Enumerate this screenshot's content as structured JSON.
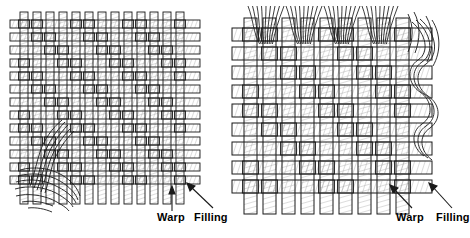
{
  "figure": {
    "background_color": "#ffffff",
    "line_color": "#1a1a1a",
    "yarn_fill": "#ffffff",
    "shade_color": "#8a8a8a"
  },
  "panels": [
    {
      "id": "left-panel",
      "name": "fine-twill-weave",
      "weave_type": "twill",
      "yarn_count_warp": 13,
      "yarn_count_filling": 13,
      "frayed_edges": [
        "bottom-left"
      ],
      "labels": [
        {
          "id": "warp",
          "text": "Warp",
          "pointer": "vertical-arrow-up"
        },
        {
          "id": "filling",
          "text": "Filling",
          "pointer": "diagonal-arrow-up-left"
        }
      ]
    },
    {
      "id": "right-panel",
      "name": "coarse-twill-weave",
      "weave_type": "twill",
      "yarn_count_warp": 9,
      "yarn_count_filling": 9,
      "frayed_edges": [
        "top",
        "right"
      ],
      "labels": [
        {
          "id": "warp",
          "text": "Warp",
          "pointer": "diagonal-arrow-up-right"
        },
        {
          "id": "filling",
          "text": "Filling",
          "pointer": "diagonal-arrow-up-left"
        }
      ]
    }
  ]
}
